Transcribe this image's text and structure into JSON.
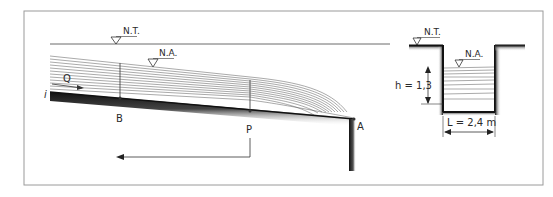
{
  "figure": {
    "longitudinal": {
      "ground_level_label": "N.T.",
      "water_level_label": "N.A.",
      "flow_label": "Q",
      "slope_label": "i",
      "point_b": "B",
      "point_p": "P",
      "point_a": "A"
    },
    "cross_section": {
      "ground_level_label": "N.T.",
      "water_level_label": "N.A.",
      "height_label": "h = 1,3",
      "width_label": "L = 2,4 m"
    }
  },
  "colors": {
    "frame": "#9a9a9a",
    "line": "#333333",
    "bed_dark": "#1a1a1a",
    "bed_light": "#bdbdbd"
  }
}
